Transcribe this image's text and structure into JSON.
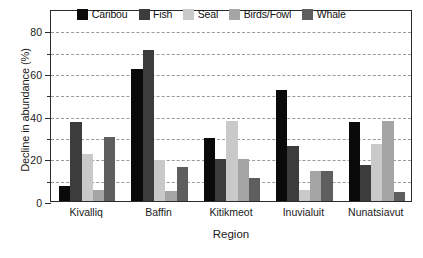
{
  "chart_data": {
    "type": "bar",
    "title": "",
    "xlabel": "Region",
    "ylabel": "Decline in abundance (%)",
    "ylim": [
      0,
      90
    ],
    "yticks": [
      0,
      20,
      40,
      60,
      80
    ],
    "ytick_labels": [
      "0",
      "20",
      "40",
      "60",
      "80"
    ],
    "yminor_ticks": [
      10,
      30,
      50,
      70
    ],
    "grid": true,
    "grid_values": [
      10,
      20,
      30,
      40,
      50,
      60,
      70,
      80
    ],
    "grid_style": "dashed-horizontal",
    "legend_position": "top-center-inside",
    "categories": [
      "Kivalliq",
      "Baffin",
      "Kitikmeot",
      "Inuvialuit",
      "Nunatsiavut"
    ],
    "series": [
      {
        "name": "Caribou",
        "color": "#0a0a0a",
        "values": [
          7,
          62,
          29.5,
          52,
          37
        ]
      },
      {
        "name": "Fish",
        "color": "#3c3c3c",
        "values": [
          37,
          71,
          19.5,
          26,
          17
        ]
      },
      {
        "name": "Seal",
        "color": "#c9c9c9",
        "values": [
          22,
          19,
          37.5,
          5,
          26.5
        ]
      },
      {
        "name": "Birds/Fowl",
        "color": "#a5a5a5",
        "values": [
          5,
          4.5,
          19.5,
          14,
          37.5
        ]
      },
      {
        "name": "Whale",
        "color": "#5e5e5e",
        "values": [
          30,
          16,
          11,
          14,
          4
        ]
      }
    ]
  },
  "colors": {
    "axis": "#2b2b2b",
    "gridline": "#9a9a9a",
    "text": "#1a1a1a",
    "background": "#ffffff"
  }
}
